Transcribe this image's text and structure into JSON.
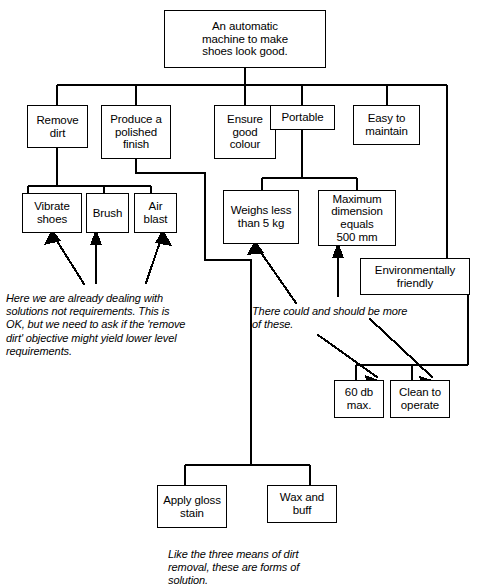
{
  "diagram": {
    "nodes": [
      {
        "id": "root",
        "label": "An automatic\nmachine to make\nshoes look good."
      },
      {
        "id": "remove",
        "label": "Remove\ndirt"
      },
      {
        "id": "polish",
        "label": "Produce a\npolished\nfinish"
      },
      {
        "id": "colour",
        "label": "Ensure\ngood\ncolour"
      },
      {
        "id": "portable",
        "label": "Portable"
      },
      {
        "id": "maintain",
        "label": "Easy to\nmaintain"
      },
      {
        "id": "vibrate",
        "label": "Vibrate\nshoes"
      },
      {
        "id": "brush",
        "label": "Brush"
      },
      {
        "id": "airblast",
        "label": "Air\nblast"
      },
      {
        "id": "weighs",
        "label": "Weighs less\nthan 5 kg"
      },
      {
        "id": "maxdim",
        "label": "Maximum\ndimension\nequals\n500 mm"
      },
      {
        "id": "enviro",
        "label": "Environmentally\nfriendly"
      },
      {
        "id": "noise",
        "label": "60 db\nmax."
      },
      {
        "id": "clean",
        "label": "Clean to\noperate"
      },
      {
        "id": "gloss",
        "label": "Apply gloss\nstain"
      },
      {
        "id": "wax",
        "label": "Wax and\nbuff"
      }
    ],
    "annotations": [
      {
        "id": "note-solutions",
        "text": "Here we are already dealing with\nsolutions not requirements. This is\nOK, but we need to ask if the 'remove\ndirt' objective might yield lower level\nrequirements."
      },
      {
        "id": "note-more",
        "text": "There could and should be more\nof these."
      },
      {
        "id": "note-forms",
        "text": "Like the three means of dirt\nremoval, these are forms of\nsolution."
      }
    ],
    "colors": {
      "line": "#000000",
      "box_fill": "#ffffff",
      "text": "#000000"
    }
  }
}
